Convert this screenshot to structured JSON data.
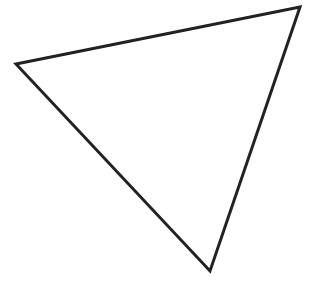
{
  "diagram": {
    "shape": "triangle",
    "vertices": [
      [
        16,
        64
      ],
      [
        300,
        7
      ],
      [
        210,
        271
      ]
    ],
    "stroke_color": "#222222",
    "stroke_width": 3,
    "fill": "none",
    "background": "#ffffff"
  }
}
